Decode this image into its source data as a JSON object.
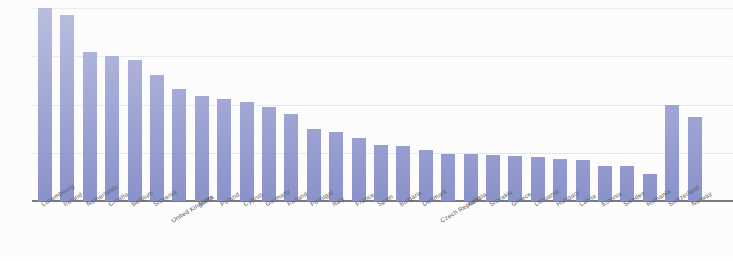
{
  "chart_data": {
    "type": "bar",
    "title": "",
    "subtitle": "",
    "xlabel": "",
    "ylabel": "",
    "ylim": [
      0,
      400
    ],
    "yticks": [
      0,
      100,
      200,
      300,
      400
    ],
    "ytick_labels": [
      "0",
      "100",
      "200",
      "300",
      "400"
    ],
    "grid": true,
    "legend": "none",
    "bar_color": "#7b84c4",
    "axis_color": "#6b6b6b",
    "grid_color": "#d8d8dc",
    "categories": [
      "Luxembourg",
      "Ireland",
      "Netherlands",
      "Croatia",
      "Belgium",
      "Slovenia",
      "United Kingdom",
      "Malta",
      "Poland",
      "Cyprus",
      "Germany",
      "Finland",
      "Portugal",
      "Italy",
      "France",
      "Spain",
      "Bulgaria",
      "Denmark",
      "Czech Republic",
      "Austria",
      "Slovakia",
      "Greece",
      "Lithuania",
      "Hungary",
      "Latvia",
      "Estonia",
      "Sweden",
      "Romania",
      "Switzerland",
      "Norway"
    ],
    "values": [
      400,
      385,
      308,
      300,
      293,
      262,
      232,
      218,
      211,
      205,
      194,
      180,
      149,
      144,
      130,
      117,
      113,
      106,
      98,
      97,
      95,
      93,
      91,
      88,
      85,
      72,
      72,
      57,
      200,
      175
    ]
  }
}
